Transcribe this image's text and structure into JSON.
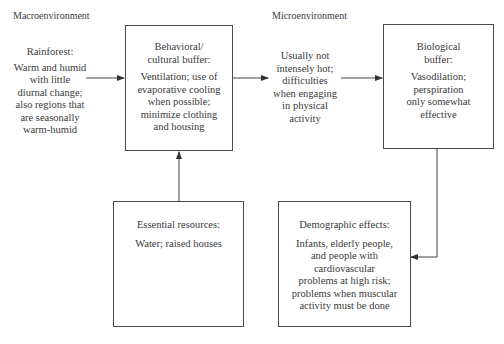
{
  "headers": {
    "macro": "Macroenvironment",
    "micro": "Microenvironment"
  },
  "nodes": {
    "rainforest": {
      "title": "Rainforest:",
      "lines": [
        "Warm and humid",
        "with little",
        "diurnal change;",
        "also regions that",
        "are seasonally",
        "warm-humid"
      ]
    },
    "behavioral": {
      "title_lines": [
        "Behavioral/",
        "cultural buffer:"
      ],
      "lines": [
        "Ventilation; use of",
        "evaporative cooling",
        "when possible;",
        "minimize clothing",
        "and housing"
      ]
    },
    "micro_condition": {
      "lines": [
        "Usually not",
        "intensely hot;",
        "difficulties",
        "when engaging",
        "in physical",
        "activity"
      ]
    },
    "biological": {
      "title_lines": [
        "Biological",
        "buffer:"
      ],
      "lines": [
        "Vasodilation;",
        "perspiration",
        "only somewhat",
        "effective"
      ]
    },
    "essential": {
      "title": "Essential resources:",
      "lines": [
        "Water; raised houses"
      ]
    },
    "demographic": {
      "title": "Demographic effects:",
      "lines": [
        "Infants, elderly people,",
        "and people with",
        "cardiovascular",
        "problems at high risk;",
        "problems when muscular",
        "activity must be done"
      ]
    }
  },
  "edges": [
    {
      "from": "rainforest",
      "to": "behavioral"
    },
    {
      "from": "behavioral",
      "to": "micro_condition"
    },
    {
      "from": "micro_condition",
      "to": "biological"
    },
    {
      "from": "essential",
      "to": "behavioral"
    },
    {
      "from": "biological",
      "to": "demographic"
    }
  ]
}
